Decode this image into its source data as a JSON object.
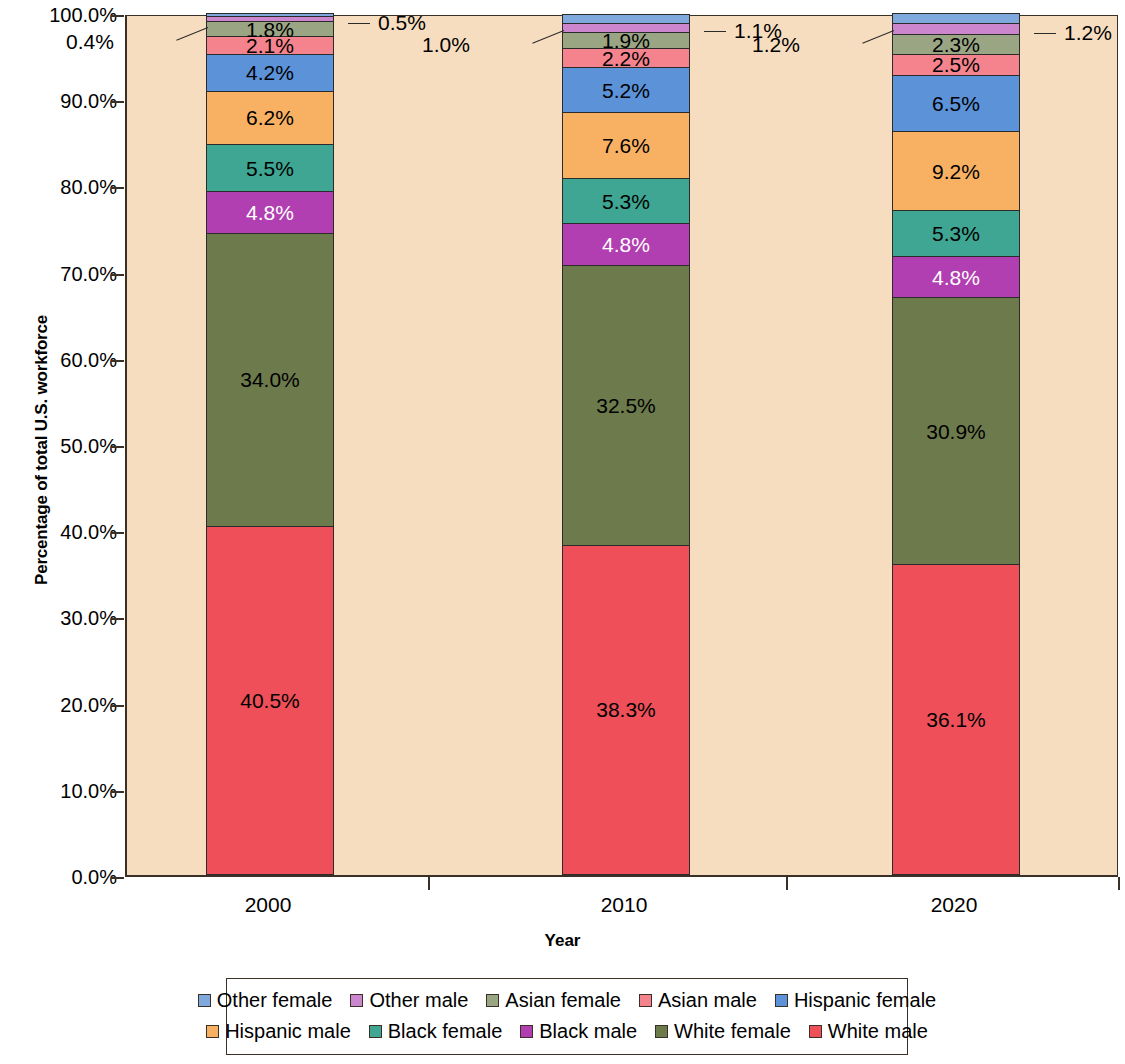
{
  "chart_data": {
    "type": "bar",
    "stacked": true,
    "normalized_percent": true,
    "title": "",
    "xlabel": "Year",
    "ylabel": "Percentage of total U.S. workforce",
    "categories": [
      "2000",
      "2010",
      "2020"
    ],
    "ylim": [
      0,
      100
    ],
    "ytick_labels": [
      "0.0%",
      "10.0%",
      "20.0%",
      "30.0%",
      "40.0%",
      "50.0%",
      "60.0%",
      "70.0%",
      "80.0%",
      "90.0%",
      "100.0%"
    ],
    "ytick_values": [
      0,
      10,
      20,
      30,
      40,
      50,
      60,
      70,
      80,
      90,
      100
    ],
    "grid": false,
    "legend_position": "bottom",
    "series": [
      {
        "name": "White male",
        "color": "#ee4f58",
        "values": [
          40.5,
          38.3,
          36.1
        ],
        "labels": [
          "40.5%",
          "38.3%",
          "36.1%"
        ],
        "label_color": "dark",
        "label_placement": "inside"
      },
      {
        "name": "White female",
        "color": "#6d7a4c",
        "values": [
          34.0,
          32.5,
          30.9
        ],
        "labels": [
          "34.0%",
          "32.5%",
          "30.9%"
        ],
        "label_color": "dark",
        "label_placement": "inside"
      },
      {
        "name": "Black male",
        "color": "#b13fb1",
        "values": [
          4.8,
          4.8,
          4.8
        ],
        "labels": [
          "4.8%",
          "4.8%",
          "4.8%"
        ],
        "label_color": "light",
        "label_placement": "inside"
      },
      {
        "name": "Black female",
        "color": "#3ea693",
        "values": [
          5.5,
          5.3,
          5.3
        ],
        "labels": [
          "5.5%",
          "5.3%",
          "5.3%"
        ],
        "label_color": "dark",
        "label_placement": "inside"
      },
      {
        "name": "Hispanic male",
        "color": "#f8b163",
        "values": [
          6.2,
          7.6,
          9.2
        ],
        "labels": [
          "6.2%",
          "7.6%",
          "9.2%"
        ],
        "label_color": "dark",
        "label_placement": "inside"
      },
      {
        "name": "Hispanic female",
        "color": "#5b92d8",
        "values": [
          4.2,
          5.2,
          6.5
        ],
        "labels": [
          "4.2%",
          "5.2%",
          "6.5%"
        ],
        "label_color": "dark",
        "label_placement": "inside"
      },
      {
        "name": "Asian male",
        "color": "#f5838d",
        "values": [
          2.1,
          2.2,
          2.5
        ],
        "labels": [
          "2.1%",
          "2.2%",
          "2.5%"
        ],
        "label_color": "dark",
        "label_placement": "inside"
      },
      {
        "name": "Asian female",
        "color": "#9aa583",
        "values": [
          1.8,
          1.9,
          2.3
        ],
        "labels": [
          "1.8%",
          "1.9%",
          "2.3%"
        ],
        "label_color": "dark",
        "label_placement": "inside"
      },
      {
        "name": "Other male",
        "color": "#cb86cd",
        "values": [
          0.5,
          1.1,
          1.2
        ],
        "labels": [
          "0.5%",
          "1.1%",
          "1.2%"
        ],
        "label_color": "dark",
        "label_placement": "callout-right"
      },
      {
        "name": "Other female",
        "color": "#7fa9dd",
        "values": [
          0.4,
          1.0,
          1.2
        ],
        "labels": [
          "0.4%",
          "1.0%",
          "1.2%"
        ],
        "label_color": "dark",
        "label_placement": "callout-left"
      }
    ],
    "legend_entries": [
      {
        "label": "Other female",
        "color": "#7fa9dd"
      },
      {
        "label": "Other male",
        "color": "#cb86cd"
      },
      {
        "label": "Asian female",
        "color": "#9aa583"
      },
      {
        "label": "Asian male",
        "color": "#f5838d"
      },
      {
        "label": "Hispanic female",
        "color": "#5b92d8"
      },
      {
        "label": "Hispanic male",
        "color": "#f8b163"
      },
      {
        "label": "Black female",
        "color": "#3ea693"
      },
      {
        "label": "Black male",
        "color": "#b13fb1"
      },
      {
        "label": "White female",
        "color": "#6d7a4c"
      },
      {
        "label": "White male",
        "color": "#ee4f58"
      }
    ],
    "plot_background_color": "#f7ddbf",
    "axis_color": "#3a3026"
  }
}
